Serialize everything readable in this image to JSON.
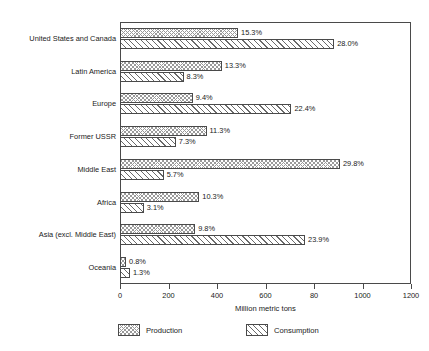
{
  "chart_data": {
    "type": "bar",
    "orientation": "horizontal",
    "title": "",
    "xlabel": "Million metric tons",
    "ylabel": "",
    "xlim": [
      0,
      1200
    ],
    "xticks": [
      0,
      200,
      400,
      600,
      800,
      1000,
      1200
    ],
    "xtick_labels": [
      "0",
      "200",
      "400",
      "600",
      "80",
      "1000",
      "1200"
    ],
    "grid": false,
    "legend_position": "bottom",
    "categories": [
      "United States and Canada",
      "Latin America",
      "Europe",
      "Former USSR",
      "Middle East",
      "Africa",
      "Asia (excl. Middle East)",
      "Oceania"
    ],
    "series": [
      {
        "name": "Production",
        "values": [
          487,
          420,
          300,
          357,
          907,
          327,
          310,
          25
        ],
        "labels": [
          "15.3%",
          "13.3%",
          "9.4%",
          "11.3%",
          "29.8%",
          "10.3%",
          "9.8%",
          "0.8%"
        ]
      },
      {
        "name": "Consumption",
        "values": [
          883,
          262,
          707,
          230,
          180,
          98,
          763,
          41
        ],
        "labels": [
          "28.0%",
          "8.3%",
          "22.4%",
          "7.3%",
          "5.7%",
          "3.1%",
          "23.9%",
          "1.3%"
        ]
      }
    ]
  },
  "legend": {
    "items": [
      {
        "label": "Production",
        "pattern": "crosshatch"
      },
      {
        "label": "Consumption",
        "pattern": "diagonal-hatch"
      }
    ]
  },
  "colors": {
    "axis": "#4a4a4a",
    "text": "#1a1a1a",
    "background": "#ffffff",
    "production_hatch": "#9a9a9a",
    "consumption_hatch": "#6a6a6a"
  }
}
